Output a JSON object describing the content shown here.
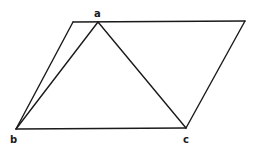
{
  "diagram": {
    "type": "geometry",
    "colors": {
      "stroke": "#1a1a1a",
      "background": "#ffffff"
    },
    "points": {
      "p_tl": {
        "x": 73,
        "y": 22
      },
      "a": {
        "x": 98,
        "y": 22
      },
      "p_tr": {
        "x": 245,
        "y": 21
      },
      "b": {
        "x": 16,
        "y": 129
      },
      "c": {
        "x": 186,
        "y": 128
      }
    },
    "labels": {
      "a": "a",
      "b": "b",
      "c": "c"
    },
    "edges": [
      [
        "p_tl",
        "p_tr"
      ],
      [
        "p_tr",
        "c"
      ],
      [
        "c",
        "b"
      ],
      [
        "b",
        "p_tl"
      ],
      [
        "b",
        "a"
      ],
      [
        "a",
        "c"
      ]
    ]
  }
}
